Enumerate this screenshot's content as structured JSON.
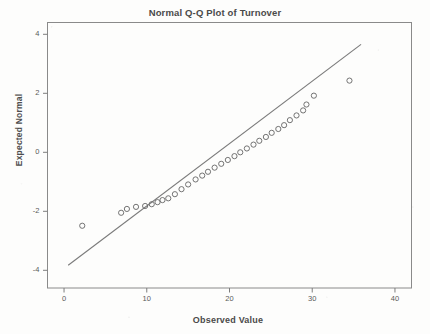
{
  "chart_data": {
    "type": "scatter",
    "title": "Normal Q-Q Plot of Turnover",
    "xlabel": "Observed Value",
    "ylabel": "Expected Normal",
    "xlim": [
      -2.0,
      42.0
    ],
    "ylim": [
      -4.6,
      4.4
    ],
    "xticks": [
      0,
      10,
      20,
      30,
      40
    ],
    "yticks": [
      4,
      2,
      0,
      -2,
      -4
    ],
    "xtick_labels": [
      "0",
      "10",
      "20",
      "30",
      "40"
    ],
    "ytick_labels": [
      "4",
      "2",
      "0",
      "-2",
      "-4"
    ],
    "grid": false,
    "legend": null,
    "marker": "open-circle",
    "marker_color": "#6b6b6b",
    "reference_line": {
      "label": "normal reference line",
      "color": "#7a7a7a",
      "x_start": 0.5,
      "y_start": -3.83,
      "x_end": 35.9,
      "y_end": 3.66
    },
    "points": [
      {
        "x": 2.2,
        "y": -2.49
      },
      {
        "x": 6.9,
        "y": -2.05
      },
      {
        "x": 7.6,
        "y": -1.92
      },
      {
        "x": 8.7,
        "y": -1.85
      },
      {
        "x": 9.8,
        "y": -1.82
      },
      {
        "x": 10.6,
        "y": -1.76
      },
      {
        "x": 11.3,
        "y": -1.69
      },
      {
        "x": 11.9,
        "y": -1.62
      },
      {
        "x": 12.6,
        "y": -1.56
      },
      {
        "x": 13.4,
        "y": -1.42
      },
      {
        "x": 14.2,
        "y": -1.25
      },
      {
        "x": 15.0,
        "y": -1.09
      },
      {
        "x": 15.9,
        "y": -0.92
      },
      {
        "x": 16.7,
        "y": -0.79
      },
      {
        "x": 17.4,
        "y": -0.66
      },
      {
        "x": 18.2,
        "y": -0.52
      },
      {
        "x": 19.0,
        "y": -0.39
      },
      {
        "x": 19.8,
        "y": -0.26
      },
      {
        "x": 20.6,
        "y": -0.13
      },
      {
        "x": 21.3,
        "y": 0.0
      },
      {
        "x": 22.1,
        "y": 0.13
      },
      {
        "x": 22.9,
        "y": 0.26
      },
      {
        "x": 23.6,
        "y": 0.39
      },
      {
        "x": 24.4,
        "y": 0.52
      },
      {
        "x": 25.1,
        "y": 0.66
      },
      {
        "x": 25.9,
        "y": 0.79
      },
      {
        "x": 26.6,
        "y": 0.92
      },
      {
        "x": 27.3,
        "y": 1.09
      },
      {
        "x": 28.1,
        "y": 1.25
      },
      {
        "x": 28.9,
        "y": 1.42
      },
      {
        "x": 29.3,
        "y": 1.62
      },
      {
        "x": 30.2,
        "y": 1.92
      },
      {
        "x": 34.5,
        "y": 2.43
      }
    ],
    "n_points": 33
  }
}
